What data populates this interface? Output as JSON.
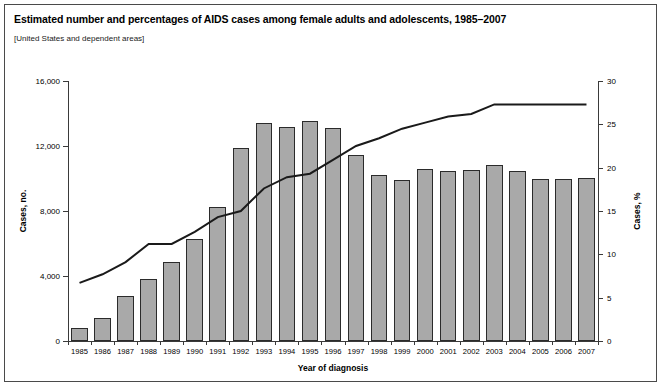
{
  "figure": {
    "title": "Estimated number and percentages of AIDS cases among female adults and adolescents, 1985–2007",
    "subtitle": "[United States and dependent areas]"
  },
  "chart_data": {
    "type": "bar",
    "title": "Estimated number and percentages of AIDS cases among female adults and adolescents, 1985–2007",
    "subtitle": "[United States and dependent areas]",
    "xlabel": "Year of diagnosis",
    "ylabel": "Cases, no.",
    "ylabel_secondary": "Cases, %",
    "categories": [
      "1985",
      "1986",
      "1987",
      "1988",
      "1989",
      "1990",
      "1991",
      "1992",
      "1993",
      "1994",
      "1995",
      "1996",
      "1997",
      "1998",
      "1999",
      "2000",
      "2001",
      "2002",
      "2003",
      "2004",
      "2005",
      "2006",
      "2007"
    ],
    "ylim": [
      0,
      16000
    ],
    "yticks": [
      0,
      4000,
      8000,
      12000,
      16000
    ],
    "ytick_labels": [
      "0",
      "4,000",
      "8,000",
      "12,000",
      "16,000"
    ],
    "ylim_secondary": [
      0,
      30
    ],
    "yticks_secondary": [
      0,
      5,
      10,
      15,
      20,
      25,
      30
    ],
    "ytick_labels_secondary": [
      "0",
      "5",
      "10",
      "15",
      "20",
      "25",
      "30"
    ],
    "grid": false,
    "legend_position": "none",
    "series": [
      {
        "name": "Cases, no.",
        "chart_type": "bar",
        "axis": "left",
        "color": "#a9a9a9",
        "edge_color": "#2b2b2b",
        "values": [
          800,
          1400,
          2750,
          3800,
          4850,
          6250,
          8250,
          11900,
          13400,
          13200,
          13550,
          13100,
          11450,
          10200,
          9900,
          10600,
          10450,
          10500,
          10850,
          10450,
          10000,
          9950,
          10050
        ]
      },
      {
        "name": "Cases, %",
        "chart_type": "line",
        "axis": "right",
        "color": "#1a1a1a",
        "values": [
          6.7,
          7.7,
          9.1,
          11.2,
          11.2,
          12.6,
          14.3,
          15.0,
          17.6,
          18.9,
          19.3,
          20.9,
          22.5,
          23.4,
          24.5,
          25.2,
          25.9,
          26.2,
          27.3,
          27.3,
          27.3,
          27.3,
          27.3
        ]
      }
    ]
  }
}
